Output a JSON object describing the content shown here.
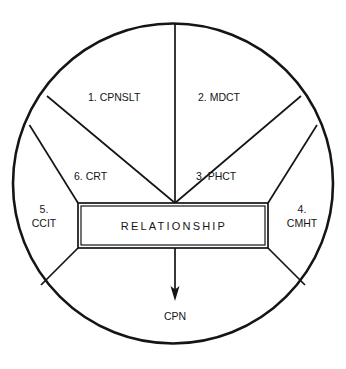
{
  "diagram": {
    "title": "RELATIONSHIP",
    "type": "circular-sector-diagram",
    "center_box": {
      "label": "RELATIONSHIP"
    },
    "output": {
      "label": "CPN",
      "arrow": "down-arrow"
    },
    "sectors": [
      {
        "number": "1.",
        "code": "CPNSLT",
        "label": "1. CPNSLT",
        "position": "upper-left"
      },
      {
        "number": "2.",
        "code": "MDCT",
        "label": "2. MDCT",
        "position": "upper-right"
      },
      {
        "number": "3.",
        "code": "PHCT",
        "label": "3. PHCT",
        "position": "middle-right"
      },
      {
        "number": "4.",
        "code": "CMHT",
        "label_line1": "4.",
        "label_line2": "CMHT",
        "position": "right"
      },
      {
        "number": "5.",
        "code": "CCIT",
        "label_line1": "5.",
        "label_line2": "CCIT",
        "position": "left"
      },
      {
        "number": "6.",
        "code": "CRT",
        "label": "6. CRT",
        "position": "middle-left"
      }
    ],
    "colors": {
      "stroke": "#151515",
      "background": "#ffffff"
    }
  }
}
